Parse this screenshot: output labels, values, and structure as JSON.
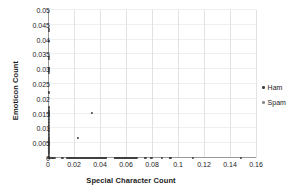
{
  "chart_data": {
    "type": "scatter",
    "title": "",
    "xlabel": "Special Character Count",
    "ylabel": "Emoticon Count",
    "xlim": [
      0,
      0.16
    ],
    "ylim": [
      0,
      0.05
    ],
    "xticks": [
      "0",
      "0.02",
      "0.04",
      "0.06",
      "0.08",
      "0.1",
      "0.12",
      "0.14",
      "0.16"
    ],
    "xtick_values": [
      0,
      0.02,
      0.04,
      0.06,
      0.08,
      0.1,
      0.12,
      0.14,
      0.16
    ],
    "yticks": [
      "0",
      "0.005",
      "0.01",
      "0.015",
      "0.02",
      "0.025",
      "0.03",
      "0.035",
      "0.04",
      "0.045",
      "0.05"
    ],
    "ytick_values": [
      0,
      0.005,
      0.01,
      0.015,
      0.02,
      0.025,
      0.03,
      0.035,
      0.04,
      0.045,
      0.05
    ],
    "grid": true,
    "grid_axis": "both",
    "legend_position": "right",
    "marker_size": 2.2,
    "series": [
      {
        "name": "Ham",
        "color": "#3f3f3f",
        "points": [
          [
            0.0005,
            0.0435
          ],
          [
            0.0005,
            0.0428
          ],
          [
            0.0005,
            0.0395
          ],
          [
            0.0005,
            0.0342
          ],
          [
            0.0005,
            0.0334
          ],
          [
            0.0005,
            0.0302
          ],
          [
            0.0005,
            0.0295
          ],
          [
            0.0005,
            0.0288
          ],
          [
            0.0005,
            0.0221
          ],
          [
            0.0005,
            0.0173
          ],
          [
            0.0005,
            0.0168
          ],
          [
            0.0005,
            0.0162
          ],
          [
            0.0005,
            0.0157
          ],
          [
            0.0005,
            0.0152
          ],
          [
            0.0005,
            0.0147
          ],
          [
            0.0005,
            0.0142
          ],
          [
            0.0005,
            0.0137
          ],
          [
            0.0005,
            0.0132
          ],
          [
            0.0005,
            0.0127
          ],
          [
            0.0005,
            0.0122
          ],
          [
            0.0005,
            0.0117
          ],
          [
            0.0005,
            0.0112
          ],
          [
            0.0005,
            0.0107
          ],
          [
            0.0005,
            0.0102
          ],
          [
            0.0005,
            0.0097
          ],
          [
            0.0005,
            0.0092
          ],
          [
            0.0005,
            0.0087
          ],
          [
            0.0005,
            0.0082
          ],
          [
            0.0005,
            0.0077
          ],
          [
            0.0005,
            0.0072
          ],
          [
            0.0005,
            0.0067
          ],
          [
            0.0005,
            0.0062
          ],
          [
            0.0005,
            0.0057
          ],
          [
            0.0005,
            0.0052
          ],
          [
            0.0005,
            0.0047
          ],
          [
            0.0005,
            0.0042
          ],
          [
            0.0005,
            0.0037
          ],
          [
            0.0005,
            0.0032
          ],
          [
            0.0005,
            0.0027
          ],
          [
            0.0005,
            0.0022
          ],
          [
            0.0005,
            0.0017
          ],
          [
            0.0005,
            0.0012
          ],
          [
            0.0005,
            0.0007
          ],
          [
            0.0005,
            0.0003
          ],
          [
            0.0005,
            0.0
          ],
          [
            0.0232,
            0.0066
          ],
          [
            0.0338,
            0.0153
          ],
          [
            0.0,
            0.0
          ],
          [
            0.0008,
            0.0
          ],
          [
            0.0016,
            0.0
          ],
          [
            0.0024,
            0.0
          ],
          [
            0.0034,
            0.0
          ],
          [
            0.0042,
            0.0
          ],
          [
            0.0052,
            0.0
          ],
          [
            0.0105,
            0.0
          ],
          [
            0.0112,
            0.0
          ],
          [
            0.0148,
            0.0
          ],
          [
            0.0154,
            0.0
          ],
          [
            0.016,
            0.0
          ],
          [
            0.0166,
            0.0
          ],
          [
            0.0172,
            0.0
          ],
          [
            0.0178,
            0.0
          ],
          [
            0.0184,
            0.0
          ],
          [
            0.019,
            0.0
          ],
          [
            0.0196,
            0.0
          ],
          [
            0.0202,
            0.0
          ],
          [
            0.0208,
            0.0
          ],
          [
            0.0214,
            0.0
          ],
          [
            0.022,
            0.0
          ],
          [
            0.0226,
            0.0
          ],
          [
            0.0232,
            0.0
          ],
          [
            0.0238,
            0.0
          ],
          [
            0.0244,
            0.0
          ],
          [
            0.025,
            0.0
          ],
          [
            0.0256,
            0.0
          ],
          [
            0.0262,
            0.0
          ],
          [
            0.0268,
            0.0
          ],
          [
            0.0274,
            0.0
          ],
          [
            0.028,
            0.0
          ],
          [
            0.0286,
            0.0
          ],
          [
            0.0292,
            0.0
          ],
          [
            0.0298,
            0.0
          ],
          [
            0.0304,
            0.0
          ],
          [
            0.031,
            0.0
          ],
          [
            0.0316,
            0.0
          ],
          [
            0.0322,
            0.0
          ],
          [
            0.0328,
            0.0
          ],
          [
            0.0334,
            0.0
          ],
          [
            0.034,
            0.0
          ],
          [
            0.0346,
            0.0
          ],
          [
            0.0352,
            0.0
          ],
          [
            0.0358,
            0.0
          ],
          [
            0.0364,
            0.0
          ],
          [
            0.037,
            0.0
          ],
          [
            0.0376,
            0.0
          ],
          [
            0.0382,
            0.0
          ],
          [
            0.0388,
            0.0
          ],
          [
            0.0394,
            0.0
          ],
          [
            0.04,
            0.0
          ],
          [
            0.0406,
            0.0
          ],
          [
            0.0412,
            0.0
          ],
          [
            0.0418,
            0.0
          ],
          [
            0.0424,
            0.0
          ],
          [
            0.043,
            0.0
          ],
          [
            0.0436,
            0.0
          ],
          [
            0.0442,
            0.0
          ],
          [
            0.0448,
            0.0
          ],
          [
            0.0512,
            0.0
          ],
          [
            0.0518,
            0.0
          ],
          [
            0.0524,
            0.0
          ],
          [
            0.053,
            0.0
          ],
          [
            0.0536,
            0.0
          ],
          [
            0.0542,
            0.0
          ],
          [
            0.0548,
            0.0
          ],
          [
            0.0554,
            0.0
          ],
          [
            0.056,
            0.0
          ],
          [
            0.0566,
            0.0
          ],
          [
            0.0572,
            0.0
          ],
          [
            0.0578,
            0.0
          ],
          [
            0.0584,
            0.0
          ],
          [
            0.059,
            0.0
          ],
          [
            0.0596,
            0.0
          ],
          [
            0.0602,
            0.0
          ],
          [
            0.0608,
            0.0
          ],
          [
            0.0614,
            0.0
          ],
          [
            0.062,
            0.0
          ],
          [
            0.0626,
            0.0
          ],
          [
            0.0632,
            0.0
          ],
          [
            0.0638,
            0.0
          ],
          [
            0.0644,
            0.0
          ],
          [
            0.065,
            0.0
          ],
          [
            0.0656,
            0.0
          ],
          [
            0.0662,
            0.0
          ],
          [
            0.0668,
            0.0
          ],
          [
            0.0674,
            0.0
          ],
          [
            0.068,
            0.0
          ],
          [
            0.0745,
            0.0
          ],
          [
            0.0752,
            0.0
          ],
          [
            0.0792,
            0.0
          ],
          [
            0.0798,
            0.0
          ],
          [
            0.0875,
            0.0
          ],
          [
            0.0935,
            0.0
          ],
          [
            0.0942,
            0.0
          ],
          [
            0.1115,
            0.0
          ],
          [
            0.1485,
            0.0
          ]
        ]
      },
      {
        "name": "Spam",
        "color": "#8c8c8c",
        "points": []
      }
    ]
  },
  "legend": {
    "items": [
      {
        "label": "Ham",
        "color": "#3f3f3f"
      },
      {
        "label": "Spam",
        "color": "#8c8c8c"
      }
    ]
  }
}
